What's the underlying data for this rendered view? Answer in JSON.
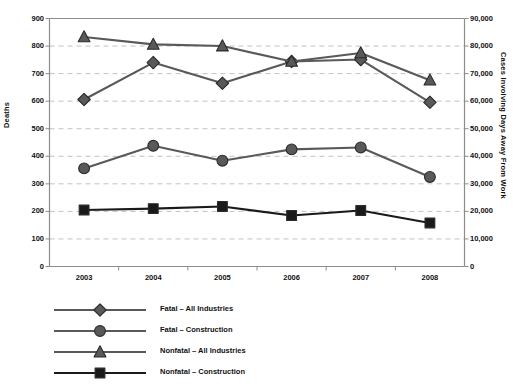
{
  "chart_data": {
    "type": "line",
    "title": "",
    "xlabel": "",
    "categories": [
      "2003",
      "2004",
      "2005",
      "2006",
      "2007",
      "2008"
    ],
    "y_left": {
      "label": "Deaths",
      "ticks": [
        "0",
        "100",
        "200",
        "300",
        "400",
        "500",
        "600",
        "700",
        "800",
        "900"
      ],
      "tick_values": [
        0,
        100,
        200,
        300,
        400,
        500,
        600,
        700,
        800,
        900
      ],
      "ylim": [
        0,
        900
      ]
    },
    "y_right": {
      "label": "Cases Involving Days Away From Work",
      "ticks": [
        "0",
        "10,000",
        "20,000",
        "30,000",
        "40,000",
        "50,000",
        "60,000",
        "70,000",
        "80,000",
        "90,000"
      ],
      "tick_values": [
        0,
        10000,
        20000,
        30000,
        40000,
        50000,
        60000,
        70000,
        80000,
        90000
      ],
      "ylim": [
        0,
        90000
      ]
    },
    "grid": true,
    "legend_position": "bottom-left",
    "series": [
      {
        "name": "Fatal – All Industries",
        "marker": "diamond",
        "axis": "left",
        "color": "#595959",
        "values": [
          606,
          740,
          665,
          744,
          751,
          596
        ]
      },
      {
        "name": "Fatal – Construction",
        "marker": "circle",
        "axis": "left",
        "color": "#595959",
        "values": [
          356,
          438,
          384,
          425,
          432,
          325
        ]
      },
      {
        "name": "Nonfatal – All Industries",
        "marker": "triangle",
        "axis": "right",
        "color": "#595959",
        "values": [
          83300,
          80600,
          80000,
          74400,
          77500,
          67600
        ]
      },
      {
        "name": "Nonfatal – Construction",
        "marker": "square",
        "axis": "right",
        "color": "#1a1a1a",
        "values": [
          20500,
          21000,
          21800,
          18500,
          20300,
          15800
        ]
      }
    ]
  },
  "colors": {
    "gray_series": "#595959",
    "dark_series": "#1a1a1a",
    "gridline": "#b9c4cc",
    "axis_line": "#8c8c8c",
    "background": "#ffffff"
  }
}
